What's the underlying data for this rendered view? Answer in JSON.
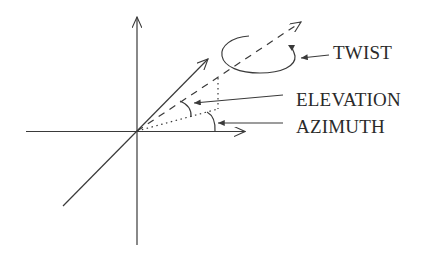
{
  "diagram": {
    "labels": {
      "twist": "TWIST",
      "elevation": "ELEVATION",
      "azimuth": "AZIMUTH"
    },
    "elements": {
      "axes": [
        "vertical-axis",
        "horizontal-axis",
        "depth-axis"
      ],
      "view_vector": "dashed arrow from origin",
      "projection": "dotted line to horizontal plane with dotted vertical drop",
      "twist_indicator": "open ellipse with arrowhead around view vector",
      "elevation_arc": "angle between projection and view vector",
      "azimuth_arc": "angle between horizontal axis and projection"
    },
    "colors": {
      "stroke": "#3a3a3a",
      "text": "#2a2a2a",
      "background": "#ffffff"
    }
  }
}
